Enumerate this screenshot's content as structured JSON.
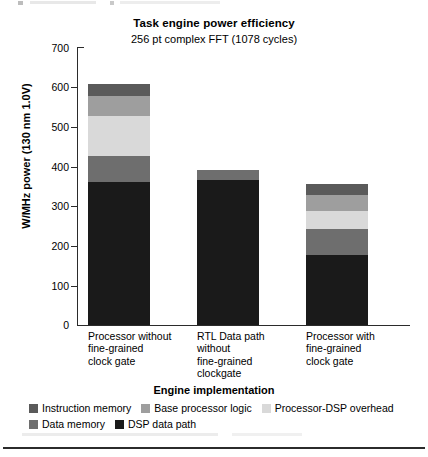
{
  "chart_data": {
    "type": "bar",
    "stacked": true,
    "title": "Task engine power efficiency",
    "subtitle": "256 pt complex FFT (1078 cycles)",
    "xlabel": "Engine implementation",
    "ylabel": "W/MHz power (130 nm 1.0V)",
    "ylim": [
      0,
      700
    ],
    "ytick_step": 100,
    "yticks": [
      "700",
      "600",
      "500",
      "400",
      "300",
      "200",
      "100",
      "0"
    ],
    "grid": false,
    "legend_position": "bottom",
    "categories": [
      "Processor without fine-grained clock gate",
      "RTL Data path without fine-grained clockgate",
      "Processor with fine-grained clock gate"
    ],
    "category_label_lines": [
      [
        "Processor without",
        "fine-grained",
        "clock gate"
      ],
      [
        "RTL Data path",
        "without",
        "fine-grained",
        "clockgate"
      ],
      [
        "Processor with",
        "fine-grained",
        "clock gate"
      ]
    ],
    "series": [
      {
        "name": "DSP data path",
        "color": "#1a1a1a",
        "values": [
          360,
          365,
          175
        ]
      },
      {
        "name": "Data memory",
        "color": "#6e6e6e",
        "values": [
          65,
          25,
          65
        ]
      },
      {
        "name": "Processor-DSP overhead",
        "color": "#d9d9d9",
        "values": [
          100,
          0,
          45
        ]
      },
      {
        "name": "Base processor logic",
        "color": "#9e9e9e",
        "values": [
          50,
          0,
          40
        ]
      },
      {
        "name": "Instruction memory",
        "color": "#5a5a5a",
        "values": [
          30,
          0,
          30
        ]
      }
    ],
    "totals": [
      605,
      390,
      355
    ],
    "legend_rows": [
      [
        {
          "label": "Instruction memory",
          "color": "#5a5a5a"
        },
        {
          "label": "Base processor logic",
          "color": "#9e9e9e"
        },
        {
          "label": "Processor-DSP overhead",
          "color": "#d9d9d9"
        }
      ],
      [
        {
          "label": "Data memory",
          "color": "#6e6e6e"
        },
        {
          "label": "DSP data path",
          "color": "#1a1a1a"
        }
      ]
    ]
  }
}
